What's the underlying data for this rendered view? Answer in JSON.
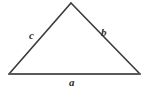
{
  "figure": {
    "type": "geometry-diagram",
    "shape": "triangle",
    "background_color": "#ffffff",
    "stroke_color": "#3a3a3a",
    "base_stroke_color": "#5a5a5a",
    "label_color": "#2e2e2e"
  },
  "vertices": {
    "apex": {
      "x": 71,
      "y": 3
    },
    "bottom_left": {
      "x": 9,
      "y": 74
    },
    "bottom_right": {
      "x": 140,
      "y": 74
    }
  },
  "labels": {
    "left_side": "c",
    "right_side": "b",
    "base": "a"
  }
}
